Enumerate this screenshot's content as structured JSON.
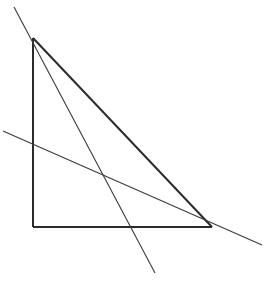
{
  "figure": {
    "width": 264,
    "height": 285,
    "background_color": "#ffffff",
    "stroke_color_thick": "#2b2b2b",
    "stroke_color_thin": "#3a3a3a",
    "points": {
      "apex": {
        "label": "apex",
        "x": 33,
        "y": 38
      },
      "right_angle": {
        "label": "right-angle-vertex",
        "x": 33,
        "y": 227
      },
      "base_right": {
        "label": "base-right-vertex",
        "x": 212,
        "y": 227
      },
      "cevian_start": {
        "label": "cevian-top-end",
        "x": 14,
        "y": 7
      },
      "cevian_end": {
        "label": "cevian-bottom-end",
        "x": 155,
        "y": 273
      },
      "secant_start": {
        "label": "secant-left-end",
        "x": 3,
        "y": 131
      },
      "secant_end": {
        "label": "secant-right-end",
        "x": 262,
        "y": 245
      },
      "lines_intersection": {
        "label": "transversal-crossing",
        "x": 105,
        "y": 177
      },
      "cevian_base_crossing": {
        "label": "cevian-base-crossing",
        "x": 133,
        "y": 227
      }
    },
    "segments": [
      {
        "name": "triangle-left-side",
        "role": "vertical leg",
        "weight": "thick",
        "x1": 33,
        "y1": 38,
        "x2": 33,
        "y2": 227
      },
      {
        "name": "triangle-base",
        "role": "horizontal leg",
        "weight": "thick",
        "x1": 33,
        "y1": 227,
        "x2": 212,
        "y2": 227
      },
      {
        "name": "triangle-hypotenuse",
        "role": "hypotenuse",
        "weight": "thick",
        "x1": 33,
        "y1": 38,
        "x2": 212,
        "y2": 227
      },
      {
        "name": "steep-transversal",
        "role": "steep line through apex past the base",
        "weight": "thin",
        "x1": 14,
        "y1": 7,
        "x2": 155,
        "y2": 273
      },
      {
        "name": "shallow-transversal",
        "role": "shallow line crossing the triangle near base-right vertex",
        "weight": "thin",
        "x1": 3,
        "y1": 131,
        "x2": 262,
        "y2": 245
      }
    ]
  }
}
